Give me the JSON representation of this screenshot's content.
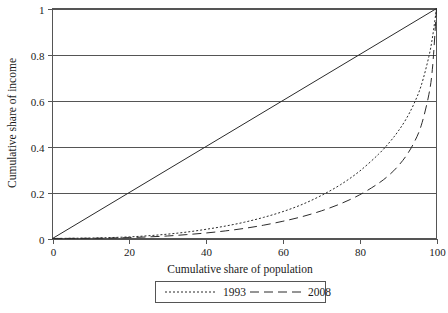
{
  "chart_data": {
    "type": "line",
    "title": "",
    "xlabel": "Cumulative share of population",
    "ylabel": "Cumulative share of income",
    "xlim": [
      0,
      100
    ],
    "ylim": [
      0,
      1
    ],
    "grid": true,
    "grid_axis": "y",
    "legend_position": "bottom-center",
    "xticks": [
      0,
      20,
      40,
      60,
      80,
      100
    ],
    "xtick_labels": [
      "0",
      "20",
      "40",
      "60",
      "80",
      "100"
    ],
    "yticks": [
      0,
      0.2,
      0.4,
      0.6,
      0.8,
      1
    ],
    "ytick_labels": [
      "0",
      "0.2",
      "0.4",
      "0.6",
      "0.8",
      "1"
    ],
    "series": [
      {
        "name": "line of equality",
        "style": "solid",
        "in_legend": false,
        "x": [
          0,
          100
        ],
        "values": [
          0,
          1
        ]
      },
      {
        "name": "1993",
        "style": "dotted",
        "in_legend": true,
        "x": [
          0,
          5,
          10,
          15,
          20,
          25,
          30,
          35,
          40,
          45,
          50,
          55,
          60,
          65,
          70,
          75,
          80,
          85,
          88,
          90,
          92,
          94,
          96,
          98,
          99,
          100
        ],
        "values": [
          0,
          0.001,
          0.002,
          0.004,
          0.007,
          0.012,
          0.019,
          0.028,
          0.04,
          0.054,
          0.071,
          0.092,
          0.117,
          0.148,
          0.187,
          0.234,
          0.293,
          0.368,
          0.423,
          0.466,
          0.517,
          0.581,
          0.664,
          0.79,
          0.88,
          1
        ]
      },
      {
        "name": "2008",
        "style": "dashed",
        "in_legend": true,
        "x": [
          0,
          5,
          10,
          15,
          20,
          25,
          30,
          35,
          40,
          45,
          50,
          55,
          60,
          65,
          70,
          75,
          80,
          85,
          88,
          90,
          92,
          94,
          96,
          98,
          99,
          100
        ],
        "values": [
          0,
          0.0005,
          0.001,
          0.002,
          0.004,
          0.007,
          0.011,
          0.017,
          0.024,
          0.033,
          0.044,
          0.058,
          0.075,
          0.095,
          0.12,
          0.151,
          0.19,
          0.241,
          0.281,
          0.315,
          0.357,
          0.412,
          0.49,
          0.625,
          0.75,
          1
        ]
      }
    ],
    "legend_entries": [
      {
        "label": "1993",
        "style": "dotted"
      },
      {
        "label": "2008",
        "style": "dashed"
      }
    ],
    "colors": {
      "line": "#2b2b2b",
      "axis": "#555555",
      "grid": "#555555",
      "background": "#ffffff"
    }
  }
}
